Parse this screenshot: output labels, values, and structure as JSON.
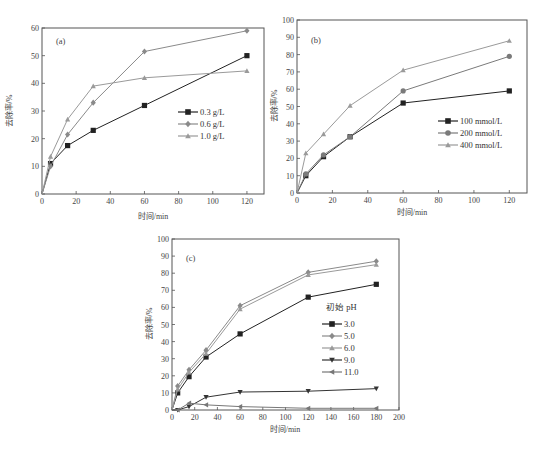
{
  "chart_data": [
    {
      "type": "line",
      "panel_label": "(a)",
      "title": "",
      "xlabel": "时间/min",
      "ylabel": "去除率/%",
      "x": [
        0,
        5,
        15,
        30,
        60,
        120
      ],
      "xlim": [
        0,
        130
      ],
      "ylim": [
        0,
        60
      ],
      "xticks": [
        0,
        20,
        40,
        60,
        80,
        100,
        120
      ],
      "yticks": [
        0,
        10,
        20,
        30,
        40,
        50,
        60
      ],
      "grid": false,
      "legend_position": "center-right",
      "series": [
        {
          "name": "0.3 g/L",
          "marker": "square",
          "color": "#222222",
          "values": [
            0,
            11,
            17.5,
            23,
            32,
            50
          ]
        },
        {
          "name": "0.6 g/L",
          "marker": "diamond",
          "color": "#8a8a8a",
          "values": [
            0,
            10,
            21.5,
            33,
            51.5,
            59
          ]
        },
        {
          "name": "1.0 g/L",
          "marker": "triangle-up",
          "color": "#9a9a9a",
          "values": [
            0,
            13.5,
            27,
            39,
            42,
            44.5
          ]
        }
      ]
    },
    {
      "type": "line",
      "panel_label": "(b)",
      "title": "",
      "xlabel": "时间/min",
      "ylabel": "去除率/%",
      "x": [
        0,
        5,
        15,
        30,
        60,
        120
      ],
      "xlim": [
        0,
        130
      ],
      "ylim": [
        0,
        100
      ],
      "xticks": [
        0,
        20,
        40,
        60,
        80,
        100,
        120
      ],
      "yticks": [
        0,
        10,
        20,
        30,
        40,
        50,
        60,
        70,
        80,
        90,
        100
      ],
      "grid": false,
      "legend_position": "center-right",
      "series": [
        {
          "name": "100 mmol/L",
          "marker": "square",
          "color": "#222222",
          "values": [
            0,
            10,
            21,
            32.5,
            52,
            59
          ]
        },
        {
          "name": "200 mmol/L",
          "marker": "circle",
          "color": "#7a7a7a",
          "values": [
            0,
            11,
            22,
            32.5,
            59,
            79
          ]
        },
        {
          "name": "400 mmol/L",
          "marker": "triangle-up",
          "color": "#9a9a9a",
          "values": [
            0,
            23,
            34,
            50.5,
            71,
            88
          ]
        }
      ]
    },
    {
      "type": "line",
      "panel_label": "(c)",
      "title": "",
      "xlabel": "时间/min",
      "ylabel": "去除率/%",
      "legend_title": "初始 pH",
      "x": [
        0,
        5,
        15,
        30,
        60,
        120,
        180
      ],
      "xlim": [
        0,
        200
      ],
      "ylim": [
        0,
        100
      ],
      "xticks": [
        0,
        20,
        40,
        60,
        80,
        100,
        120,
        140,
        160,
        180,
        200
      ],
      "yticks": [
        0,
        10,
        20,
        30,
        40,
        50,
        60,
        70,
        80,
        90,
        100
      ],
      "grid": false,
      "legend_position": "center-right",
      "series": [
        {
          "name": "3.0",
          "marker": "square",
          "color": "#222222",
          "values": [
            0,
            10,
            19.5,
            31,
            44.5,
            66,
            73.5
          ]
        },
        {
          "name": "5.0",
          "marker": "diamond",
          "color": "#8a8a8a",
          "values": [
            0,
            14,
            23.5,
            35,
            61,
            80.5,
            87
          ]
        },
        {
          "name": "6.0",
          "marker": "triangle-up",
          "color": "#9a9a9a",
          "values": [
            0,
            12,
            22,
            33,
            59,
            79,
            85
          ]
        },
        {
          "name": "9.0",
          "marker": "triangle-down",
          "color": "#333333",
          "values": [
            0,
            0,
            2,
            7.5,
            10.5,
            11,
            12.5
          ]
        },
        {
          "name": "11.0",
          "marker": "triangle-left",
          "color": "#777777",
          "values": [
            0,
            0,
            4,
            3,
            2,
            1,
            1
          ]
        }
      ]
    }
  ]
}
